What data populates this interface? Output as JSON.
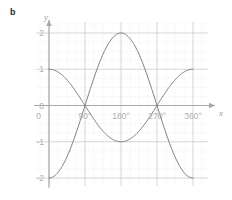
{
  "figure": {
    "part_label": "b",
    "background": "#ffffff"
  },
  "chart_data": {
    "type": "line",
    "title": "",
    "subtitle": "",
    "xlabel": "x",
    "ylabel": "y",
    "xlim": [
      -45,
      405
    ],
    "ylim": [
      -2.45,
      2.45
    ],
    "xticks": [
      0,
      90,
      180,
      270,
      360
    ],
    "xticklabels": [
      "0",
      "90°",
      "180°",
      "270°",
      "360°"
    ],
    "yticks": [
      2,
      1,
      0,
      -1,
      -2
    ],
    "yticklabels": [
      "2",
      "1",
      "0",
      "-1",
      "-2"
    ],
    "grid": true,
    "grid_major_color": "#c9c9c9",
    "grid_minor_color": "#dedede",
    "grid_minor_step_x": 22.5,
    "grid_minor_step_y": 0.25,
    "grid_major_step_x": 90,
    "grid_major_step_y": 1,
    "axis_color": "#a8a8a8",
    "legend": "none",
    "series": [
      {
        "name": "y = cos x",
        "color": "#6e6e6e",
        "amplitude": 1,
        "phase_deg": 0,
        "x": [
          0,
          15,
          30,
          45,
          60,
          75,
          90,
          105,
          120,
          135,
          150,
          165,
          180,
          195,
          210,
          225,
          240,
          255,
          270,
          285,
          300,
          315,
          330,
          345,
          360
        ],
        "values": [
          1.0,
          0.966,
          0.866,
          0.707,
          0.5,
          0.259,
          0.0,
          -0.259,
          -0.5,
          -0.707,
          -0.866,
          -0.966,
          -1.0,
          -0.966,
          -0.866,
          -0.707,
          -0.5,
          -0.259,
          0.0,
          0.259,
          0.5,
          0.707,
          0.866,
          0.966,
          1.0
        ],
        "key_points": [
          {
            "x": 0,
            "y": 1
          },
          {
            "x": 90,
            "y": 0
          },
          {
            "x": 180,
            "y": -1
          },
          {
            "x": 270,
            "y": 0
          },
          {
            "x": 360,
            "y": 1
          }
        ]
      },
      {
        "name": "y = -2 cos x",
        "color": "#6e6e6e",
        "amplitude": 2,
        "phase_deg": 180,
        "x": [
          0,
          15,
          30,
          45,
          60,
          75,
          90,
          105,
          120,
          135,
          150,
          165,
          180,
          195,
          210,
          225,
          240,
          255,
          270,
          285,
          300,
          315,
          330,
          345,
          360
        ],
        "values": [
          -2.0,
          -1.932,
          -1.732,
          -1.414,
          -1.0,
          -0.518,
          0.0,
          0.518,
          1.0,
          1.414,
          1.732,
          1.932,
          2.0,
          1.932,
          1.732,
          1.414,
          1.0,
          0.518,
          0.0,
          -0.518,
          -1.0,
          -1.414,
          -1.732,
          -1.932,
          -2.0
        ],
        "key_points": [
          {
            "x": 0,
            "y": -2
          },
          {
            "x": 90,
            "y": 0
          },
          {
            "x": 180,
            "y": 2
          },
          {
            "x": 270,
            "y": 0
          },
          {
            "x": 360,
            "y": -2
          }
        ]
      }
    ],
    "intersections": [
      {
        "x": 90,
        "y": 0
      },
      {
        "x": 270,
        "y": 0
      }
    ]
  }
}
